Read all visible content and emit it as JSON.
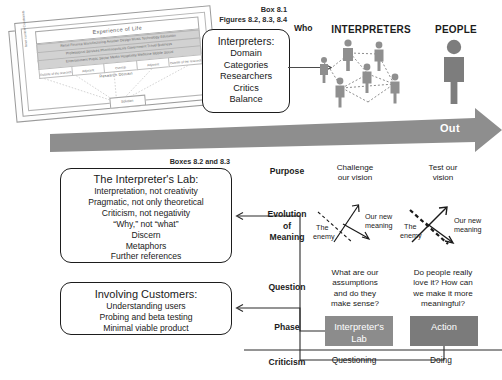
{
  "figure": {
    "card": {
      "title": "Experience of Life",
      "bands": [
        "Retail Finance Manufacturing Aviation Design Music Technology Education",
        "Professional Services Pharmaceuticals Government Travel Business",
        "Entertainment Public Sector Media Hospitality Medicine Mobile Social"
      ],
      "columns": [
        "Outside of the research",
        "Adjacent",
        "Overlap",
        "Adjacent",
        "Outside of the research"
      ],
      "subtitle": "Research Domain",
      "solution": "Solution",
      "side_label": "Inner context Constraints"
    },
    "box81_caption": "Box 8.1\nFigures 8.2, 8.3, 8.4",
    "box81_caption_lines": [
      "Box 8.1",
      "Figures 8.2, 8.3, 8.4"
    ],
    "interpreters_box": {
      "heading": "Interpreters:",
      "items": [
        "Domain",
        "Categories",
        "Researchers",
        "Critics",
        "Balance"
      ]
    },
    "who_label": "Who",
    "headers": {
      "interpreters": "INTERPRETERS",
      "people": "PEOPLE"
    },
    "out_band": {
      "label": "Out",
      "color": "#8e8e8e",
      "text_color": "#ffffff"
    },
    "box8283_caption": "Boxes 8.2 and 8.3",
    "lab_box": {
      "heading": "The Interpreter's Lab:",
      "items": [
        "Interpretation, not creativity",
        "Pragmatic, not only theoretical",
        "Criticism, not negativity",
        "“Why,” not “what”",
        "Discern",
        "Metaphors",
        "Further references"
      ]
    },
    "customers_box": {
      "heading": "Involving Customers:",
      "items": [
        "Understanding users",
        "Probing and beta testing",
        "Minimal viable product"
      ]
    },
    "rows": [
      {
        "label": "Purpose"
      },
      {
        "label": "Evolution\nof\nMeaning",
        "label_lines": [
          "Evolution",
          "of",
          "Meaning"
        ]
      },
      {
        "label": "Question"
      },
      {
        "label": "Phase"
      },
      {
        "label": "Criticism"
      }
    ],
    "matrix": {
      "purpose": {
        "middle": "Challenge\nour vision",
        "middle_lines": [
          "Challenge",
          "our vision"
        ],
        "right": "Test our\nvision",
        "right_lines": [
          "Test our",
          "vision"
        ]
      },
      "evolution": {
        "middle": {
          "enemy_label": "The\nenemy",
          "enemy_lines": [
            "The",
            "enemy"
          ],
          "new_label": "Our new\nmeaning",
          "new_lines": [
            "Our new",
            "meaning"
          ]
        },
        "right": {
          "enemy_label": "The\nenemy",
          "enemy_lines": [
            "The",
            "enemy"
          ],
          "new_label": "Our new\nmeaning",
          "new_lines": [
            "Our new",
            "meaning"
          ]
        }
      },
      "question": {
        "middle_lines": [
          "What are our",
          "assumptions",
          "and do they",
          "make sense?"
        ],
        "right_lines": [
          "Do people really",
          "love it? How can",
          "we make it more",
          "meaningful?"
        ]
      },
      "phase": {
        "middle_lines": [
          "Interpreter's",
          "Lab"
        ],
        "middle_color": "#8c8c8c",
        "right_lines": [
          "Action"
        ],
        "right_color": "#7b7b7b"
      },
      "criticism": {
        "middle": "Questioning",
        "right": "Doing"
      }
    },
    "people_icon_color": "#8f8f8f",
    "big_person_color": "#7d7d7d"
  }
}
